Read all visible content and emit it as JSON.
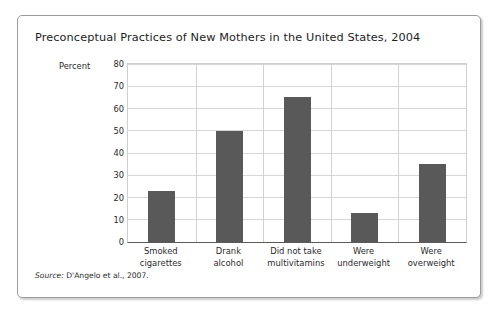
{
  "chart_data": {
    "type": "bar",
    "title": "Preconceptual Practices of New Mothers in the United States, 2004",
    "xlabel": "",
    "ylabel": "Percent",
    "ylim": [
      0,
      80
    ],
    "ytick_step": 10,
    "yticks": [
      "80",
      "70",
      "60",
      "50",
      "40",
      "30",
      "20",
      "10",
      "0"
    ],
    "grid": "horizontal-and-vertical-category-separators",
    "legend": "none",
    "categories": [
      "Smoked cigarettes",
      "Drank alcohol",
      "Did not take multivitamins",
      "Were underweight",
      "Were overweight"
    ],
    "category_lines": [
      [
        "Smoked",
        "cigarettes"
      ],
      [
        "Drank",
        "alcohol"
      ],
      [
        "Did not take",
        "multivitamins"
      ],
      [
        "Were",
        "underweight"
      ],
      [
        "Were",
        "overweight"
      ]
    ],
    "values": [
      23,
      50,
      65,
      13,
      35
    ],
    "bar_color": "#595959",
    "source_prefix": "Source:",
    "source_text": " D'Angelo et al., 2007."
  }
}
